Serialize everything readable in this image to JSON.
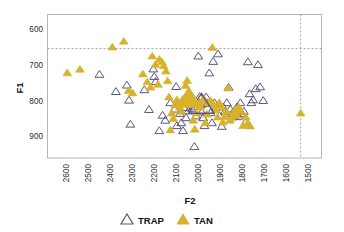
{
  "chart_data": {
    "type": "scatter",
    "title": "",
    "xlabel": "F2",
    "ylabel": "F1",
    "xlim": [
      2700,
      1450
    ],
    "ylim": [
      560,
      960
    ],
    "x_reversed": true,
    "y_reversed": true,
    "grid": false,
    "xticks": [
      2600,
      2500,
      2400,
      2300,
      2200,
      2100,
      2000,
      1900,
      1800,
      1700,
      1600,
      1500
    ],
    "xticklabels": [
      "2600",
      "2500",
      "2400",
      "2300",
      "2200",
      "2100",
      "2000",
      "1900",
      "1800",
      "1700",
      "1600",
      "1500"
    ],
    "yticks": [
      600,
      700,
      800,
      900
    ],
    "yticklabels": [
      "600",
      "700",
      "800",
      "900"
    ],
    "reference_lines": [
      {
        "orientation": "horizontal",
        "value": 655,
        "style": "dashed",
        "color": "#9a9a9a"
      },
      {
        "orientation": "vertical",
        "value": 1545,
        "style": "dashed",
        "color": "#9a9a9a"
      }
    ],
    "legend": {
      "position": "bottom",
      "entries": [
        {
          "name": "TRAP",
          "marker": "triangle-open",
          "color": "#5b5480",
          "fill": "none"
        },
        {
          "name": "TAN",
          "marker": "triangle-filled",
          "color": "#d8b22b",
          "fill": "#d8b22b"
        }
      ]
    },
    "series": [
      {
        "name": "TRAP",
        "marker": "triangle-open",
        "color": "#5b5480",
        "points": [
          [
            2463,
            727
          ],
          [
            2388,
            775
          ],
          [
            2338,
            757
          ],
          [
            2328,
            799
          ],
          [
            2322,
            866
          ],
          [
            2258,
            770
          ],
          [
            2237,
            825
          ],
          [
            2217,
            712
          ],
          [
            2213,
            733
          ],
          [
            2207,
            747
          ],
          [
            2190,
            884
          ],
          [
            2175,
            841
          ],
          [
            2163,
            855
          ],
          [
            2140,
            806
          ],
          [
            2121,
            824
          ],
          [
            2113,
            761
          ],
          [
            2110,
            870
          ],
          [
            2096,
            836
          ],
          [
            2090,
            862
          ],
          [
            2082,
            884
          ],
          [
            2076,
            820
          ],
          [
            2068,
            848
          ],
          [
            2058,
            829
          ],
          [
            2052,
            800
          ],
          [
            2046,
            806
          ],
          [
            2040,
            823
          ],
          [
            2033,
            818
          ],
          [
            2030,
            928
          ],
          [
            2022,
            843
          ],
          [
            2012,
            676
          ],
          [
            2006,
            789
          ],
          [
            2000,
            812
          ],
          [
            1996,
            832
          ],
          [
            1990,
            848
          ],
          [
            1984,
            870
          ],
          [
            1976,
            790
          ],
          [
            1970,
            808
          ],
          [
            1962,
            723
          ],
          [
            1956,
            834
          ],
          [
            1950,
            862
          ],
          [
            1944,
            691
          ],
          [
            1938,
            806
          ],
          [
            1930,
            818
          ],
          [
            1922,
            670
          ],
          [
            1916,
            842
          ],
          [
            1905,
            872
          ],
          [
            1898,
            818
          ],
          [
            1890,
            830
          ],
          [
            1882,
            806
          ],
          [
            1874,
            763
          ],
          [
            1866,
            824
          ],
          [
            1858,
            836
          ],
          [
            1850,
            841
          ],
          [
            1843,
            830
          ],
          [
            1836,
            818
          ],
          [
            1828,
            845
          ],
          [
            1820,
            806
          ],
          [
            1812,
            836
          ],
          [
            1804,
            830
          ],
          [
            1796,
            860
          ],
          [
            1786,
            692
          ],
          [
            1778,
            781
          ],
          [
            1770,
            806
          ],
          [
            1762,
            798
          ],
          [
            1750,
            767
          ],
          [
            1740,
            700
          ],
          [
            1730,
            762
          ],
          [
            1716,
            800
          ]
        ]
      },
      {
        "name": "TAN",
        "marker": "triangle-filled",
        "color": "#d8b22b",
        "points": [
          [
            2610,
            723
          ],
          [
            2552,
            713
          ],
          [
            2404,
            651
          ],
          [
            2352,
            635
          ],
          [
            2330,
            772
          ],
          [
            2312,
            779
          ],
          [
            2265,
            726
          ],
          [
            2245,
            748
          ],
          [
            2230,
            763
          ],
          [
            2222,
            676
          ],
          [
            2208,
            700
          ],
          [
            2196,
            755
          ],
          [
            2190,
            685
          ],
          [
            2178,
            692
          ],
          [
            2170,
            703
          ],
          [
            2160,
            718
          ],
          [
            2152,
            745
          ],
          [
            2146,
            790
          ],
          [
            2140,
            882
          ],
          [
            2133,
            835
          ],
          [
            2126,
            850
          ],
          [
            2118,
            812
          ],
          [
            2110,
            798
          ],
          [
            2104,
            806
          ],
          [
            2097,
            818
          ],
          [
            2090,
            831
          ],
          [
            2084,
            797
          ],
          [
            2077,
            806
          ],
          [
            2070,
            758
          ],
          [
            2063,
            744
          ],
          [
            2056,
            786
          ],
          [
            2048,
            800
          ],
          [
            2042,
            812
          ],
          [
            2035,
            855
          ],
          [
            2028,
            880
          ],
          [
            2020,
            835
          ],
          [
            2012,
            806
          ],
          [
            2004,
            818
          ],
          [
            1996,
            803
          ],
          [
            1988,
            795
          ],
          [
            1980,
            862
          ],
          [
            1972,
            838
          ],
          [
            1964,
            806
          ],
          [
            1956,
            800
          ],
          [
            1948,
            652
          ],
          [
            1940,
            812
          ],
          [
            1932,
            826
          ],
          [
            1924,
            846
          ],
          [
            1916,
            806
          ],
          [
            1908,
            818
          ],
          [
            1900,
            860
          ],
          [
            1892,
            845
          ],
          [
            1884,
            830
          ],
          [
            1876,
            765
          ],
          [
            1868,
            855
          ],
          [
            1860,
            848
          ],
          [
            1852,
            834
          ],
          [
            1844,
            826
          ],
          [
            1836,
            841
          ],
          [
            1828,
            818
          ],
          [
            1818,
            830
          ],
          [
            1808,
            870
          ],
          [
            1796,
            845
          ],
          [
            1786,
            862
          ],
          [
            1776,
            871
          ],
          [
            1545,
            835
          ]
        ]
      },
      {
        "name": "TRAP-mean",
        "marker": "triangle-open-large",
        "color": "#5b5480",
        "points": [
          [
            1998,
            812
          ]
        ]
      },
      {
        "name": "TAN-mean",
        "marker": "triangle-filled-large",
        "color": "#d8b22b",
        "points": [
          [
            2055,
            795
          ]
        ]
      }
    ]
  },
  "axes": {
    "x_title": "F2",
    "y_title": "F1"
  },
  "legend_labels": {
    "trap": "TRAP",
    "tan": "TAN"
  },
  "colors": {
    "tan_fill": "#d8b22b",
    "trap_stroke": "#5b5480",
    "frame": "#b6b6b6",
    "dash": "#9a9a9a"
  }
}
